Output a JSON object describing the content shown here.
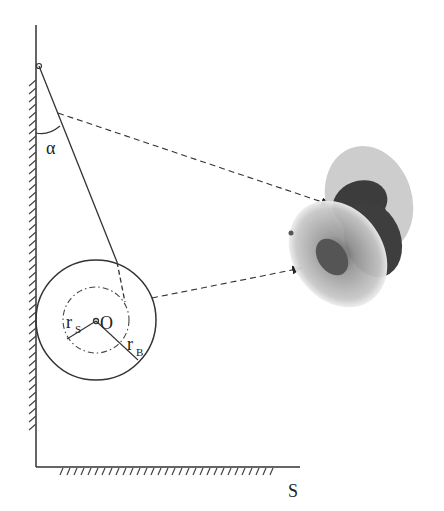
{
  "diagram": {
    "labels": {
      "angle": "α",
      "center": "O",
      "spool_radius": "r",
      "spool_radius_sub": "S",
      "body_radius": "r",
      "body_radius_sub": "B",
      "axis": "S"
    },
    "colors": {
      "line": "#333333",
      "spool_dark": "#3a3a3a",
      "spool_light": "#b8b8b8"
    }
  }
}
